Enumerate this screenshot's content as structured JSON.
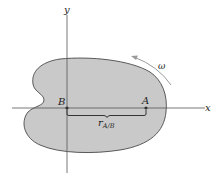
{
  "diagram": {
    "type": "rigid-body-rotation",
    "colors": {
      "body_fill": "#c9c9c9",
      "body_stroke": "#4a4a4a",
      "axis": "#555555",
      "text": "#222222",
      "arrow": "#9a9a9a"
    },
    "axes": {
      "x_label": "x",
      "y_label": "y"
    },
    "points": {
      "B": {
        "label": "B"
      },
      "A": {
        "label": "A"
      }
    },
    "vector": {
      "symbol": "r",
      "subscript": "A/B"
    },
    "angular_velocity": {
      "symbol": "ω",
      "direction": "counterclockwise"
    }
  }
}
